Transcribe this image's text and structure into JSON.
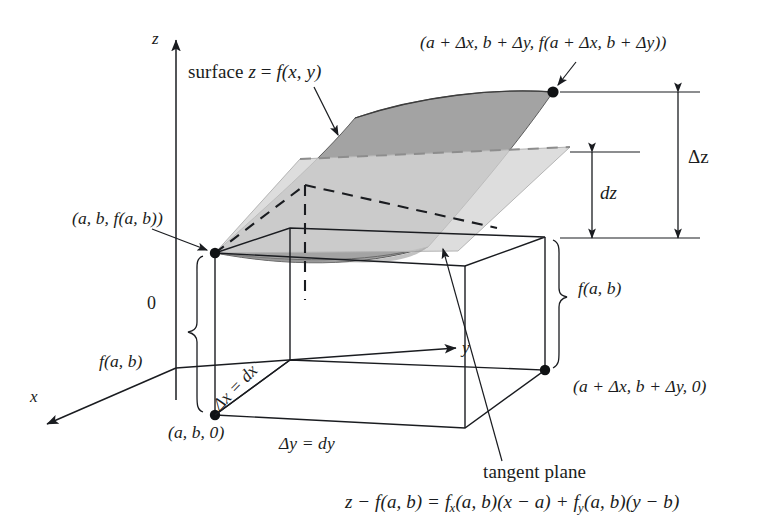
{
  "figure": {
    "kind": "math-diagram-3d",
    "background_color": "#ffffff",
    "ink_color": "#1a1c20",
    "surface_fill": "#9a9a9a",
    "tangent_plane_fill": "#d2d2d2"
  },
  "axes": {
    "z": "z",
    "y": "y",
    "x": "x",
    "origin": "0"
  },
  "labels": {
    "surface": {
      "prefix": "surface ",
      "var_z": "z",
      "equals": " = ",
      "func": "f",
      "args": "(x, y)"
    },
    "point_far": {
      "text": "(a + Δx, b + Δy, f(a + Δx, b + Δy))"
    },
    "point_near": {
      "text": "(a, b, f(a, b))"
    },
    "point_base_near": {
      "text": "(a, b, 0)"
    },
    "point_base_far": {
      "text": "(a + Δx, b + Δy, 0)"
    },
    "delta_z": "Δz",
    "dz": "dz",
    "height_left": "f(a, b)",
    "height_right": "f(a, b)",
    "delta_x": "Δx = dx",
    "delta_y": "Δy = dy",
    "tangent_plane": "tangent plane",
    "tangent_plane_equation": {
      "lhs": "z − f(a, b) = ",
      "term1_f": "f",
      "term1_sub": "x",
      "term1_rest": "(a, b)(x − a) + ",
      "term2_f": "f",
      "term2_sub": "y",
      "term2_rest": "(a, b)(y − b)"
    }
  },
  "geometry": {
    "point_near_px": [
      215,
      253
    ],
    "point_far_px": [
      553,
      92
    ],
    "point_base_near_px": [
      215,
      415
    ],
    "point_base_far_px": [
      545,
      370
    ]
  }
}
